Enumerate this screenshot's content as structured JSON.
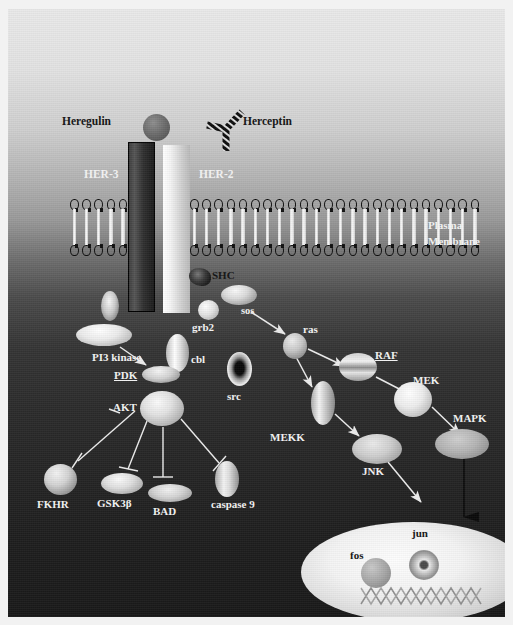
{
  "figure": {
    "compartments": {
      "membrane_label": "Plasma\nMembrane",
      "membrane_label_line1": "Plasma",
      "membrane_label_line2": "Membrane"
    }
  },
  "ligands": [
    {
      "id": "heregulin",
      "label": "Heregulin",
      "shape": "sphere",
      "color": "#6d6d6d"
    },
    {
      "id": "herceptin",
      "label": "Herceptin",
      "shape": "antibody-y",
      "color": "#0d0d0d"
    }
  ],
  "receptors": [
    {
      "id": "her3",
      "label": "HER-3",
      "shape": "bar",
      "color": "#2f2f2f"
    },
    {
      "id": "her2",
      "label": "HER-2",
      "shape": "bar",
      "color": "#e8e8e8"
    }
  ],
  "adaptors": [
    {
      "id": "shc",
      "label": "SHC",
      "shape": "irregular-cluster",
      "color": "#2a2a2a"
    },
    {
      "id": "grb2",
      "label": "grb2",
      "shape": "sphere",
      "color": "#d9d9d9"
    },
    {
      "id": "sos",
      "label": "sos",
      "shape": "ellipse",
      "color": "#cfcfcf"
    },
    {
      "id": "cbl",
      "label": "cbl",
      "shape": "ellipse-vertical",
      "color": "#d6d6d6"
    },
    {
      "id": "src",
      "label": "src",
      "shape": "ellipse-dark-core",
      "color": "#1a1a1a"
    }
  ],
  "pi3k_branch": [
    {
      "id": "pi3kinase",
      "label": "PI3 kinase",
      "shape": "ellipse-wide",
      "color": "#e6e6e6"
    },
    {
      "id": "pdk",
      "label": "PDK",
      "shape": "ellipse-wide",
      "color": "#d2d2d2"
    },
    {
      "id": "akt",
      "label": "AKT",
      "shape": "ellipse",
      "color": "#d8d8d8"
    },
    {
      "id": "fkhr",
      "label": "FKHR",
      "shape": "sphere",
      "color": "#c6c6c6"
    },
    {
      "id": "gsk3b",
      "label": "GSK3β",
      "shape": "ellipse-wide",
      "color": "#d4d4d4"
    },
    {
      "id": "bad",
      "label": "BAD",
      "shape": "ellipse-wide",
      "color": "#cdcdcd"
    },
    {
      "id": "caspase9",
      "label": "caspase 9",
      "shape": "ellipse-vertical",
      "color": "#d5d5d5"
    }
  ],
  "mapk_branch": [
    {
      "id": "ras",
      "label": "ras",
      "shape": "sphere",
      "color": "#b8b8b8"
    },
    {
      "id": "raf",
      "label": "RAF",
      "shape": "ellipse",
      "color": "#cfcfcf"
    },
    {
      "id": "mek",
      "label": "MEK",
      "shape": "ellipse",
      "color": "#e0e0e0"
    },
    {
      "id": "mapk",
      "label": "MAPK",
      "shape": "ellipse-wide",
      "color": "#b2b2b2"
    },
    {
      "id": "mekk",
      "label": "MEKK",
      "shape": "ellipse-vertical",
      "color": "#c9c9c9"
    },
    {
      "id": "jnk",
      "label": "JNK",
      "shape": "ellipse-wide",
      "color": "#c7c7c7"
    }
  ],
  "nucleus": {
    "label": "nucleus",
    "contents": [
      {
        "id": "fos",
        "label": "fos",
        "shape": "sphere",
        "color": "#a8a8a8"
      },
      {
        "id": "jun",
        "label": "jun",
        "shape": "torus",
        "color": "#bdbdbd"
      },
      {
        "id": "dna",
        "label": "DNA",
        "shape": "zigzag-helix",
        "color": "#9a9a9a"
      }
    ]
  },
  "edges": [
    {
      "from": "sos",
      "to": "ras",
      "kind": "activation"
    },
    {
      "from": "ras",
      "to": "raf",
      "kind": "activation"
    },
    {
      "from": "raf",
      "to": "mek",
      "kind": "activation"
    },
    {
      "from": "mek",
      "to": "mapk",
      "kind": "activation"
    },
    {
      "from": "ras",
      "to": "mekk",
      "kind": "activation"
    },
    {
      "from": "mekk",
      "to": "jnk",
      "kind": "activation"
    },
    {
      "from": "jnk",
      "to": "nucleus",
      "kind": "activation"
    },
    {
      "from": "mapk",
      "to": "nucleus",
      "kind": "activation"
    },
    {
      "from": "pi3kinase",
      "to": "pdk",
      "kind": "activation"
    },
    {
      "from": "akt",
      "to": "fkhr",
      "kind": "inhibition"
    },
    {
      "from": "akt",
      "to": "gsk3b",
      "kind": "inhibition"
    },
    {
      "from": "akt",
      "to": "bad",
      "kind": "inhibition"
    },
    {
      "from": "akt",
      "to": "caspase9",
      "kind": "inhibition"
    }
  ],
  "colors": {
    "background_top": "#e9e9e9",
    "background_bottom": "#191919",
    "label_dark": "#131313",
    "label_light": "#f3f3f3",
    "arrow_light": "#ededed",
    "arrow_dark": "#0a0a0a"
  }
}
